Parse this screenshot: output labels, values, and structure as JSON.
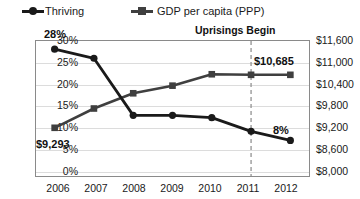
{
  "legend": {
    "items": [
      {
        "label": "Thriving",
        "marker": "circle-marker-icon",
        "color": "#1a1a1a"
      },
      {
        "label": "GDP per capita (PPP)",
        "marker": "square-marker-icon",
        "color": "#3f3f3f"
      }
    ]
  },
  "annotations": [
    {
      "name": "thriving-start-value",
      "text": "28%"
    },
    {
      "name": "gdp-start-value",
      "text": "$9,293"
    },
    {
      "name": "gdp-end-value",
      "text": "$10,685"
    },
    {
      "name": "thriving-end-value",
      "text": "8%"
    },
    {
      "name": "uprisings-marker-label",
      "text": "Uprisings Begin"
    }
  ],
  "axes": {
    "y_left_ticks": [
      "30%",
      "25%",
      "20%",
      "15%",
      "10%",
      "5%",
      "0%"
    ],
    "y_right_ticks": [
      "$11,600",
      "$11,000",
      "$10,400",
      "$9,800",
      "$9,200",
      "$8,600",
      "$8,000"
    ],
    "x_ticks": [
      "2006",
      "2007",
      "2008",
      "2009",
      "2010",
      "2011",
      "2012"
    ]
  },
  "chart_data": {
    "type": "line",
    "title": "",
    "xlabel": "",
    "ylabel": "",
    "y2label": "",
    "grid": true,
    "legend_position": "top-left",
    "categories": [
      "2006",
      "2007",
      "2008",
      "2009",
      "2010",
      "2011",
      "2012"
    ],
    "series": [
      {
        "name": "Thriving",
        "axis": "left",
        "unit": "percent",
        "marker": "circle",
        "color": "#1a1a1a",
        "values": [
          28,
          26,
          13.5,
          13.5,
          13,
          10,
          8
        ],
        "point_labels": {
          "2006": "28%",
          "2012": "8%"
        }
      },
      {
        "name": "GDP per capita (PPP)",
        "axis": "right",
        "unit": "usd",
        "marker": "square",
        "color": "#3f3f3f",
        "values": [
          9293,
          9800,
          10200,
          10400,
          10700,
          10685,
          10685
        ],
        "point_labels": {
          "2006": "$9,293",
          "2012": "$10,685"
        }
      }
    ],
    "ylim": [
      0,
      30
    ],
    "y2lim": [
      8000,
      11600
    ],
    "y_ticks": [
      0,
      5,
      10,
      15,
      20,
      25,
      30
    ],
    "y2_ticks": [
      8000,
      8600,
      9200,
      9800,
      10400,
      11000,
      11600
    ],
    "annotations": [
      {
        "type": "vline",
        "x": "2011",
        "style": "dashed",
        "color": "#9a9a9a",
        "label": "Uprisings Begin"
      }
    ]
  }
}
